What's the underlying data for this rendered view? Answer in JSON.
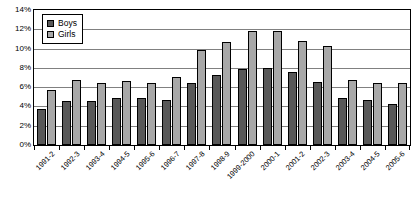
{
  "chart_data": {
    "type": "bar",
    "title": "",
    "subtitle": "",
    "xlabel": "",
    "ylabel": "",
    "ylim": [
      0,
      14
    ],
    "ytick_labels": [
      "14%",
      "12%",
      "10%",
      "8%",
      "6%",
      "4%",
      "2%",
      "0%"
    ],
    "ytick_values": [
      14,
      12,
      10,
      8,
      6,
      4,
      2,
      0
    ],
    "grid": true,
    "legend_position": "top-left",
    "categories": [
      "1991-2",
      "1992-3",
      "1993-4",
      "1994-5",
      "1995-6",
      "1996-7",
      "1997-8",
      "1998-9",
      "1999-2000",
      "2000-1",
      "2001-2",
      "2002-3",
      "2003-4",
      "2004-5",
      "2005-6"
    ],
    "series": [
      {
        "name": "Boys",
        "color": "#585858",
        "values": [
          3.7,
          4.6,
          4.6,
          4.9,
          4.9,
          4.7,
          6.4,
          7.3,
          7.9,
          8.0,
          7.6,
          6.5,
          4.9,
          4.65,
          4.25
        ]
      },
      {
        "name": "Girls",
        "color": "#a8a8a8",
        "values": [
          5.7,
          6.75,
          6.4,
          6.65,
          6.45,
          7.1,
          9.9,
          10.65,
          11.8,
          11.85,
          10.8,
          10.25,
          6.75,
          6.4,
          6.4
        ]
      }
    ]
  },
  "legend": {
    "items": [
      {
        "label": "Boys"
      },
      {
        "label": "Girls"
      }
    ]
  }
}
